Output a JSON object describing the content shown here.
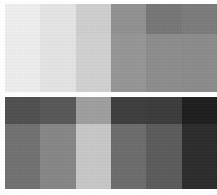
{
  "image": {
    "kind": "grayscale-patch-chart",
    "description": "Two horizontal grayscale patch bands, each divided into six columns and two sub-rows of differing gray tones, printed on a white field",
    "width": 217,
    "height": 195,
    "background_color": "#ffffff",
    "column_count": 6,
    "band_count": 2
  },
  "layout": {
    "left_margin_px": 5,
    "right_margin_px": 0,
    "top_margin_px": 4,
    "bottom_margin_px": 6,
    "band_gap_px": 5
  },
  "bands": [
    {
      "name": "upper-band",
      "top_px": 4,
      "height_px": 88,
      "left_px": 5,
      "width_px": 212,
      "subrow_split_px": 30,
      "columns": [
        {
          "name": "col-1",
          "top_color": "#ededed",
          "bottom_color": "#ececec"
        },
        {
          "name": "col-2",
          "top_color": "#e3e3e3",
          "bottom_color": "#e2e2e2"
        },
        {
          "name": "col-3",
          "top_color": "#cdcdcd",
          "bottom_color": "#cfcfcf"
        },
        {
          "name": "col-4",
          "top_color": "#8f8f8f",
          "bottom_color": "#949494"
        },
        {
          "name": "col-5",
          "top_color": "#757575",
          "bottom_color": "#8b8b8b"
        },
        {
          "name": "col-6",
          "top_color": "#7a7a7a",
          "bottom_color": "#8a8a8a"
        }
      ]
    },
    {
      "name": "lower-band",
      "top_px": 97,
      "height_px": 92,
      "left_px": 5,
      "width_px": 212,
      "subrow_split_px": 27,
      "columns": [
        {
          "name": "col-1",
          "top_color": "#4e4e4e",
          "bottom_color": "#707070"
        },
        {
          "name": "col-2",
          "top_color": "#565656",
          "bottom_color": "#858585"
        },
        {
          "name": "col-3",
          "top_color": "#9d9d9d",
          "bottom_color": "#c6c6c6"
        },
        {
          "name": "col-4",
          "top_color": "#3c3c3c",
          "bottom_color": "#6b6b6b"
        },
        {
          "name": "col-5",
          "top_color": "#3a3a3a",
          "bottom_color": "#5a5a5a"
        },
        {
          "name": "col-6",
          "top_color": "#1d1d1d",
          "bottom_color": "#2b2b2b"
        }
      ]
    }
  ]
}
